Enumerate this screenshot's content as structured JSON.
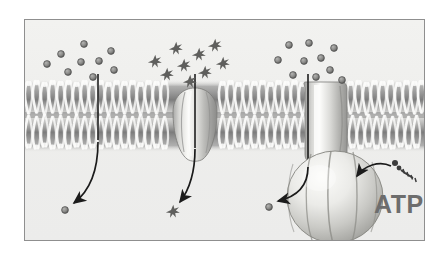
{
  "figure": {
    "background_color": "#efefed",
    "frame_border_color": "#8f8f8f",
    "page_background": "#ffffff"
  },
  "labels": {
    "atp": "ATP",
    "atp_color": "#6d6d6d"
  },
  "membrane": {
    "name": "phospholipid-bilayer",
    "top_leaflet_y": 75,
    "bottom_leaflet_y": 118,
    "color_dark": "#6a6a6a",
    "color_light": "#f2f2f0"
  },
  "panels": [
    {
      "id": "simple-diffusion",
      "solute_shape": "circle",
      "solute_count_outside": 9,
      "solute_count_inside": 1,
      "direction": "outside-to-inside",
      "transporter": "none"
    },
    {
      "id": "facilitated-diffusion",
      "solute_shape": "star",
      "solute_count_outside": 9,
      "solute_count_inside": 1,
      "direction": "outside-to-inside",
      "transporter": "channel-protein"
    },
    {
      "id": "active-transport",
      "solute_shape": "circle",
      "solute_count_outside": 10,
      "solute_count_inside": 1,
      "direction": "outside-to-inside",
      "transporter": "pump-protein",
      "energy_source": "ATP"
    }
  ],
  "solutes": {
    "circle_fill": "#8e8e8e",
    "circle_stroke": "#4a4a4a",
    "star_fill": "#6b6b6b",
    "left_group": [
      {
        "x": 22,
        "y": 44
      },
      {
        "x": 36,
        "y": 34
      },
      {
        "x": 43,
        "y": 52
      },
      {
        "x": 56,
        "y": 42
      },
      {
        "x": 59,
        "y": 24
      },
      {
        "x": 68,
        "y": 57
      },
      {
        "x": 74,
        "y": 41
      },
      {
        "x": 86,
        "y": 31
      },
      {
        "x": 89,
        "y": 50
      }
    ],
    "middle_group": [
      {
        "x": 128,
        "y": 40
      },
      {
        "x": 140,
        "y": 53
      },
      {
        "x": 149,
        "y": 27
      },
      {
        "x": 157,
        "y": 44
      },
      {
        "x": 163,
        "y": 60
      },
      {
        "x": 172,
        "y": 33
      },
      {
        "x": 178,
        "y": 51
      },
      {
        "x": 188,
        "y": 24
      },
      {
        "x": 196,
        "y": 42
      }
    ],
    "right_group": [
      {
        "x": 253,
        "y": 40
      },
      {
        "x": 264,
        "y": 25
      },
      {
        "x": 268,
        "y": 55
      },
      {
        "x": 279,
        "y": 41
      },
      {
        "x": 284,
        "y": 23
      },
      {
        "x": 291,
        "y": 57
      },
      {
        "x": 296,
        "y": 38
      },
      {
        "x": 305,
        "y": 50
      },
      {
        "x": 309,
        "y": 28
      },
      {
        "x": 317,
        "y": 60
      }
    ],
    "inside_left": {
      "x": 40,
      "y": 190
    },
    "inside_middle": {
      "x": 146,
      "y": 190
    },
    "inside_right": {
      "x": 244,
      "y": 187
    }
  },
  "arrows": [
    {
      "id": "arrow-simple-diffusion",
      "from": {
        "x": 73,
        "y": 62
      },
      "to": {
        "x": 46,
        "y": 185
      }
    },
    {
      "id": "arrow-facilitated-diffusion",
      "from": {
        "x": 170,
        "y": 62
      },
      "to": {
        "x": 152,
        "y": 186
      }
    },
    {
      "id": "arrow-active-transport",
      "from": {
        "x": 283,
        "y": 62
      },
      "to": {
        "x": 250,
        "y": 184
      }
    },
    {
      "id": "arrow-atp-binding",
      "from": {
        "x": 382,
        "y": 163
      },
      "to": {
        "x": 340,
        "y": 173
      }
    }
  ],
  "proteins": {
    "channel": {
      "name": "channel-protein",
      "center_x": 170,
      "top_y": 72,
      "bottom_y": 140,
      "width": 44,
      "fill_light": "#f4f4f2",
      "fill_shadow": "#9b9b9b"
    },
    "pump": {
      "name": "pump-protein",
      "barrel_center_x": 298,
      "barrel_top_y": 66,
      "barrel_bottom_y": 140,
      "barrel_width": 36,
      "globe_center": {
        "x": 310,
        "y": 177
      },
      "globe_rx": 48,
      "globe_ry": 47,
      "lobe_count": 5,
      "fill_light": "#efefec",
      "fill_shadow": "#a6a6a6"
    }
  },
  "atp_molecule": {
    "name": "atp-molecule-icon",
    "x": 388,
    "y": 150,
    "color": "#4f4f4f"
  }
}
